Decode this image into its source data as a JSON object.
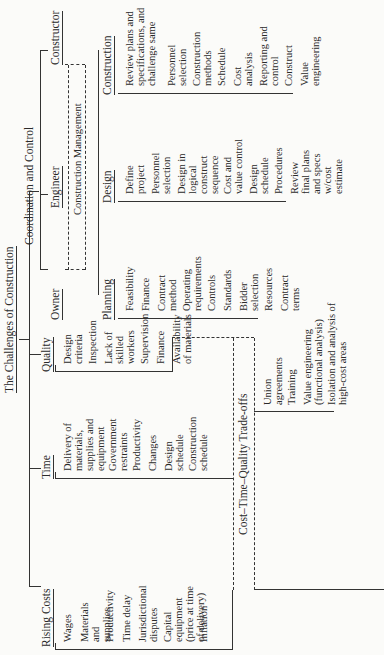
{
  "title": "The Challenges of Construction",
  "branches": {
    "rising_costs": {
      "label": "Rising Costs",
      "items": [
        "Wages",
        "Materials and supplies",
        "Productivity",
        "Time delay",
        "Jurisdictional disputes",
        "Capital equipment (price at time of delivery)",
        "Inflation"
      ]
    },
    "time": {
      "label": "Time",
      "items": [
        "Delivery of materials, supplies and equipment",
        "Government restraints",
        "Productivity",
        "Changes",
        "Design schedule",
        "Construction schedule"
      ]
    },
    "quality": {
      "label": "Quality",
      "items": [
        "Design criteria",
        "Inspection",
        "Lack of skilled workers",
        "Supervision",
        "Finance",
        "Availability of materials"
      ]
    },
    "tradeoffs": {
      "label": "Cost–Time–Quality Trade-offs",
      "items": [
        "Union agreements",
        "Training",
        "Value engineering (functional analysis)",
        "Isolation and analysis of high-cost areas"
      ]
    },
    "coordination": {
      "label": "Coordination and Control",
      "roles": [
        "Owner",
        "Engineer",
        "Constructor"
      ],
      "management": "Construction Management",
      "planning": {
        "label": "Planning",
        "items": [
          "Feasibility",
          "Finance",
          "Contract method",
          "Operating requirements",
          "Controls",
          "Standards",
          "Bidder selection",
          "Resources",
          "Contract terms"
        ]
      },
      "design": {
        "label": "Design",
        "items": [
          "Define project",
          "Personnel selection",
          "Design in logical construct sequence",
          "Cost and value control",
          "Design schedule",
          "Procedures",
          "Review final plans and specs w/cost estimate"
        ]
      },
      "construction": {
        "label": "Construction",
        "items": [
          "Review plans and specifications, and challenge same",
          "Personnel selection",
          "Construction methods",
          "Schedule",
          "Cost analysis",
          "Reporting and control",
          "Construct",
          "Value engineering"
        ]
      }
    }
  }
}
